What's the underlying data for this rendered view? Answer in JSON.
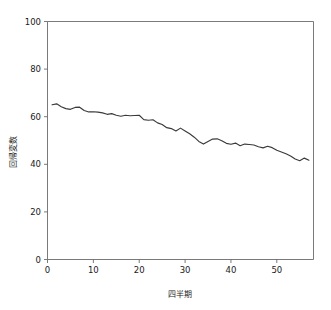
{
  "chart_data": {
    "type": "line",
    "title": "",
    "xlabel": "四半期",
    "ylabel": "回帰変数",
    "xlim": [
      0,
      58
    ],
    "ylim": [
      0,
      100
    ],
    "grid": false,
    "legend": false,
    "legend_position": "none",
    "line_color": "#3a3a3a",
    "axis_color": "#6b6b6b",
    "background_color": "#ffffff",
    "xticks": [
      0,
      10,
      20,
      30,
      40,
      50
    ],
    "xtick_labels": [
      "0",
      "10",
      "20",
      "30",
      "40",
      "50"
    ],
    "yticks": [
      0,
      20,
      40,
      60,
      80,
      100
    ],
    "ytick_labels": [
      "0",
      "20",
      "40",
      "60",
      "80",
      "100"
    ],
    "series": [
      {
        "name": "",
        "x": [
          1,
          2,
          3,
          4,
          5,
          6,
          7,
          8,
          9,
          10,
          11,
          12,
          13,
          14,
          15,
          16,
          17,
          18,
          19,
          20,
          21,
          22,
          23,
          24,
          25,
          26,
          27,
          28,
          29,
          30,
          31,
          32,
          33,
          34,
          35,
          36,
          37,
          38,
          39,
          40,
          41,
          42,
          43,
          44,
          45,
          46,
          47,
          48,
          49,
          50,
          51,
          52,
          53,
          54,
          55,
          56,
          57
        ],
        "values": [
          65.0,
          65.4,
          64.2,
          63.4,
          63.1,
          63.9,
          64.0,
          62.6,
          62.0,
          62.1,
          61.9,
          61.6,
          61.0,
          61.3,
          60.6,
          60.2,
          60.6,
          60.4,
          60.5,
          60.6,
          58.8,
          58.5,
          58.7,
          57.4,
          56.7,
          55.4,
          55.0,
          54.0,
          55.2,
          54.0,
          52.8,
          51.4,
          49.6,
          48.5,
          49.6,
          50.6,
          50.7,
          49.9,
          48.8,
          48.4,
          48.9,
          47.8,
          48.5,
          48.3,
          48.1,
          47.4,
          46.9,
          47.6,
          47.0,
          45.9,
          45.2,
          44.4,
          43.5,
          42.2,
          41.5,
          42.6,
          41.7
        ]
      }
    ]
  },
  "axes": {
    "x_axis_name": "x-axis",
    "y_axis_name": "y-axis"
  }
}
